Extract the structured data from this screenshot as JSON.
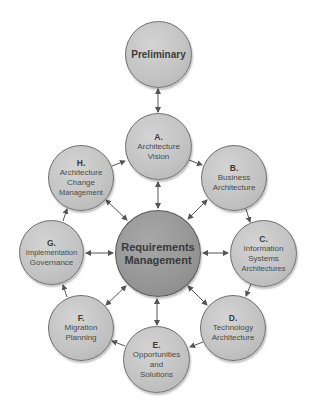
{
  "diagram": {
    "type": "cycle-hub",
    "colors": {
      "node_fill": "#c4c4c4",
      "hub_fill": "#969696",
      "border": "#6e6e6e",
      "arrow": "#555555",
      "text": "#4a4a4a"
    },
    "preliminary": {
      "lines": [
        "Preliminary"
      ]
    },
    "hub": {
      "lines": [
        "Requirements",
        "Management"
      ]
    },
    "phases": [
      {
        "letter": "A.",
        "lines": [
          "Architecture",
          "Vision"
        ]
      },
      {
        "letter": "B.",
        "lines": [
          "Business",
          "Architecture"
        ]
      },
      {
        "letter": "C.",
        "lines": [
          "Information",
          "Systems",
          "Architectures"
        ]
      },
      {
        "letter": "D.",
        "lines": [
          "Technology",
          "Architecture"
        ]
      },
      {
        "letter": "E.",
        "lines": [
          "Opportunities",
          "and",
          "Solutions"
        ]
      },
      {
        "letter": "F.",
        "lines": [
          "Migration",
          "Planning"
        ]
      },
      {
        "letter": "G.",
        "lines": [
          "Implementation",
          "Governance"
        ]
      },
      {
        "letter": "H.",
        "lines": [
          "Architecture",
          "Change",
          "Management"
        ]
      }
    ],
    "edges": [
      {
        "from": "Preliminary",
        "to": "A",
        "bidirectional": true
      },
      {
        "from": "A",
        "to": "B",
        "bidirectional": false
      },
      {
        "from": "B",
        "to": "C",
        "bidirectional": false
      },
      {
        "from": "C",
        "to": "D",
        "bidirectional": false
      },
      {
        "from": "D",
        "to": "E",
        "bidirectional": false
      },
      {
        "from": "E",
        "to": "F",
        "bidirectional": false
      },
      {
        "from": "F",
        "to": "G",
        "bidirectional": false
      },
      {
        "from": "G",
        "to": "H",
        "bidirectional": false
      },
      {
        "from": "H",
        "to": "A",
        "bidirectional": false
      },
      {
        "from": "Requirements Management",
        "to": "A",
        "bidirectional": true
      },
      {
        "from": "Requirements Management",
        "to": "B",
        "bidirectional": true
      },
      {
        "from": "Requirements Management",
        "to": "C",
        "bidirectional": true
      },
      {
        "from": "Requirements Management",
        "to": "D",
        "bidirectional": true
      },
      {
        "from": "Requirements Management",
        "to": "E",
        "bidirectional": true
      },
      {
        "from": "Requirements Management",
        "to": "F",
        "bidirectional": true
      },
      {
        "from": "Requirements Management",
        "to": "G",
        "bidirectional": true
      },
      {
        "from": "Requirements Management",
        "to": "H",
        "bidirectional": true
      }
    ]
  }
}
